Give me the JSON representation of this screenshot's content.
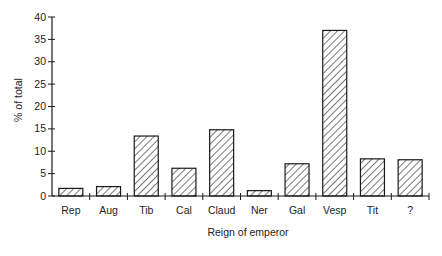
{
  "chart_data": {
    "type": "bar",
    "title": "",
    "xlabel": "Reign of emperor",
    "ylabel": "% of total",
    "categories": [
      "Rep",
      "Aug",
      "Tib",
      "Cal",
      "Claud",
      "Ner",
      "Gal",
      "Vesp",
      "Tit",
      "?"
    ],
    "values": [
      1.7,
      2.1,
      13.4,
      6.2,
      14.8,
      1.2,
      7.2,
      37.0,
      8.3,
      8.1
    ],
    "ylim": [
      0,
      40
    ],
    "yticks": [
      0,
      5,
      10,
      15,
      20,
      25,
      30,
      35,
      40
    ],
    "grid": false,
    "legend": null,
    "bar_fill": "diagonal-hatch",
    "colors": {
      "stroke": "#1a1a1a",
      "hatch": "#1a1a1a",
      "background": "#ffffff"
    }
  }
}
